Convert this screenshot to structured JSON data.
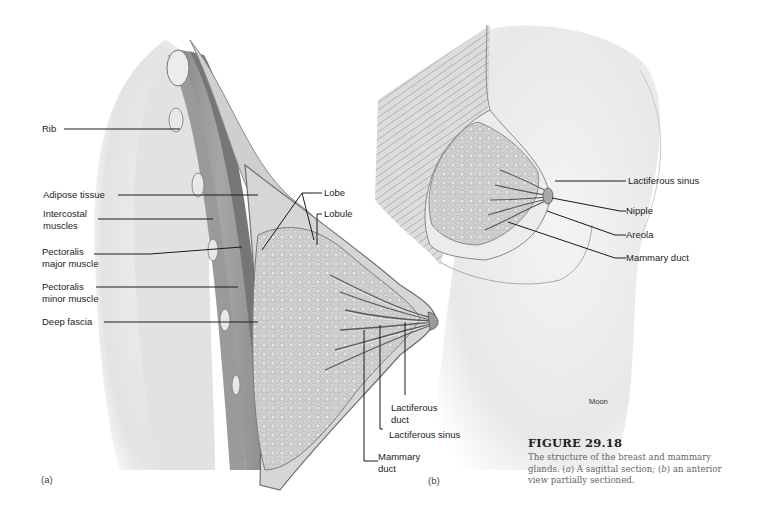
{
  "figure": {
    "number": "FIGURE 29.18",
    "caption_line1": "The structure of the breast and mammary",
    "caption_line2_a": "glands. (",
    "caption_line2_a_ital": "a",
    "caption_line2_b": ") A sagittal section; (",
    "caption_line2_b_ital": "b",
    "caption_line2_c": ") an anterior",
    "caption_line3": "view partially sectioned."
  },
  "panel_a": {
    "tag": "(a)",
    "labels": {
      "rib": "Rib",
      "adipose": "Adipose tissue",
      "intercostal_1": "Intercostal",
      "intercostal_2": "muscles",
      "pec_major_1": "Pectoralis",
      "pec_major_2": "major muscle",
      "pec_minor_1": "Pectoralis",
      "pec_minor_2": "minor muscle",
      "deep_fascia": "Deep fascia",
      "lobe": "Lobe",
      "lobule": "Lobule",
      "lact_duct_1": "Lactiferous",
      "lact_duct_2": "duct",
      "lact_sinus": "Lactiferous sinus",
      "mammary_duct_1": "Mammary",
      "mammary_duct_2": "duct"
    }
  },
  "panel_b": {
    "tag": "(b)",
    "credit": "Moon",
    "labels": {
      "lact_sinus": "Lactiferous sinus",
      "nipple": "Nipple",
      "areola": "Areola",
      "mammary_duct": "Mammary duct"
    }
  },
  "colors": {
    "leader_line": "#1a1a1a",
    "tissue_light": "#e6e6e6",
    "tissue_mid": "#b9b9b9",
    "tissue_dark": "#7d7d7d",
    "caption_text": "#666666"
  }
}
